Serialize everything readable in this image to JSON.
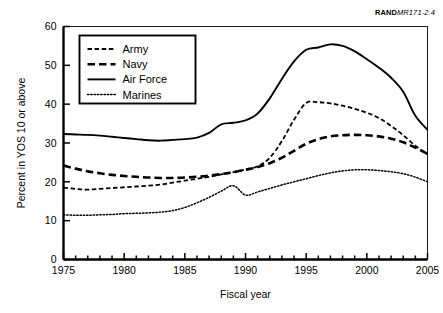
{
  "figure": {
    "corner_code_brand": "RAND",
    "corner_code_doc": "MR171-2.4"
  },
  "chart_data": {
    "type": "line",
    "title": "",
    "xlabel": "Fiscal year",
    "ylabel": "Percent in YOS 10 or above",
    "xlim": [
      1975,
      2005
    ],
    "ylim": [
      0,
      60
    ],
    "xticks": [
      1975,
      1980,
      1985,
      1990,
      1995,
      2000,
      2005
    ],
    "yticks": [
      0,
      10,
      20,
      30,
      40,
      50,
      60
    ],
    "xtick_labels": [
      "1975",
      "1980",
      "1985",
      "1990",
      "1995",
      "2000",
      "2005"
    ],
    "ytick_labels": [
      "0",
      "10",
      "20",
      "30",
      "40",
      "50",
      "60"
    ],
    "minor_xticks_every": 1,
    "grid": false,
    "legend_position": "upper-left",
    "x": [
      1975,
      1976,
      1977,
      1978,
      1979,
      1980,
      1981,
      1982,
      1983,
      1984,
      1985,
      1986,
      1987,
      1988,
      1989,
      1990,
      1991,
      1992,
      1993,
      1994,
      1995,
      1996,
      1997,
      1998,
      1999,
      2000,
      2001,
      2002,
      2003,
      2004,
      2005
    ],
    "series": [
      {
        "name": "Army",
        "dash": "dash-dot",
        "values": [
          18.5,
          18.2,
          18.0,
          18.2,
          18.4,
          18.6,
          18.8,
          19.0,
          19.3,
          19.8,
          20.3,
          20.8,
          21.3,
          21.9,
          22.5,
          23.2,
          24.0,
          26.2,
          30.5,
          36.0,
          40.3,
          40.5,
          40.2,
          39.6,
          38.8,
          37.8,
          36.4,
          34.4,
          32.0,
          29.3,
          27.1
        ]
      },
      {
        "name": "Navy",
        "dash": "dashed",
        "values": [
          24.2,
          23.4,
          22.7,
          22.2,
          21.8,
          21.5,
          21.3,
          21.1,
          21.0,
          21.0,
          21.1,
          21.3,
          21.6,
          22.0,
          22.5,
          23.1,
          23.8,
          24.8,
          26.2,
          28.0,
          29.8,
          31.0,
          31.7,
          32.0,
          32.1,
          32.0,
          31.7,
          31.1,
          30.2,
          28.8,
          27.2
        ]
      },
      {
        "name": "Air Force",
        "dash": "solid",
        "values": [
          32.3,
          32.2,
          32.1,
          31.9,
          31.6,
          31.3,
          31.0,
          30.7,
          30.6,
          30.8,
          31.0,
          31.4,
          32.6,
          34.8,
          35.2,
          35.8,
          37.6,
          41.5,
          46.5,
          51.0,
          54.0,
          54.6,
          55.4,
          55.0,
          53.6,
          51.6,
          49.4,
          46.8,
          43.2,
          37.0,
          33.4
        ]
      },
      {
        "name": "Marines",
        "dash": "dotted",
        "values": [
          11.5,
          11.4,
          11.4,
          11.5,
          11.6,
          11.8,
          11.9,
          12.0,
          12.2,
          12.6,
          13.4,
          14.6,
          16.0,
          17.6,
          19.0,
          16.6,
          17.4,
          18.3,
          19.2,
          20.0,
          20.8,
          21.6,
          22.3,
          22.8,
          23.1,
          23.1,
          22.9,
          22.6,
          22.1,
          21.2,
          20.0
        ]
      }
    ]
  },
  "legend": {
    "items": [
      {
        "label": "Army"
      },
      {
        "label": "Navy"
      },
      {
        "label": "Air Force"
      },
      {
        "label": "Marines"
      }
    ]
  }
}
